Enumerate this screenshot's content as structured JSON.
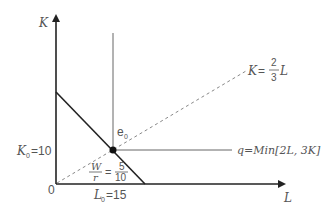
{
  "diagram": {
    "type": "isoquant-cost-minimization",
    "axes": {
      "y_label": "K",
      "x_label": "L",
      "origin_label": "0"
    },
    "ray": {
      "label_lhs": "K",
      "label_eq": "=",
      "label_num": "2",
      "label_den": "3",
      "label_var": "L"
    },
    "isoquant": {
      "label": "q=Min[2L, 3K]"
    },
    "equilibrium": {
      "label": "e",
      "label_sub": "0"
    },
    "budget_slope": {
      "lhs_num": "W",
      "lhs_den": "r",
      "eq": "=",
      "rhs_num": "5",
      "rhs_den": "10"
    },
    "k0": {
      "label": "K",
      "sub": "0",
      "value": "=10"
    },
    "l0": {
      "label": "L",
      "sub": "0",
      "value": "=15"
    },
    "colors": {
      "axis": "#222222",
      "line": "#555555",
      "dashed": "#888888",
      "text": "#555555"
    }
  }
}
